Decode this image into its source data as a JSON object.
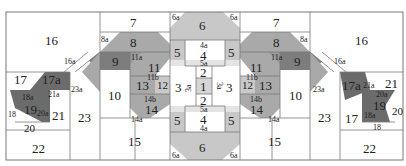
{
  "colors": {
    "background": "#ffffff",
    "light_gray": "#c8c8c8",
    "mid_gray": "#a9a9a9",
    "dark_gray": "#7d7d7d",
    "darkest_gray": "#6b6b6b",
    "seam": "#7a7a7a"
  },
  "pieces": {
    "left": {
      "p16": "16",
      "p16a": "16a",
      "p17": "17",
      "p17a": "17a",
      "p18": "18",
      "p18a": "18a",
      "p19": "19",
      "p20": "20",
      "p20a": "20a",
      "p21": "21",
      "p21a": "21a",
      "p22": "22",
      "p23": "23",
      "p23a": "23a",
      "p7": "7",
      "p8": "8",
      "p8a": "8a",
      "p9": "9",
      "p10": "10",
      "p11": "11",
      "p11a": "11a",
      "p11b": "11b",
      "p12": "12",
      "p13": "13",
      "p14": "14",
      "p14a": "14a",
      "p14b": "14b",
      "p15": "15"
    },
    "center": {
      "p1": "1",
      "p2": "2",
      "p3": "3",
      "p3a": "3a",
      "p4": "4",
      "p4a": "4a",
      "p5": "5",
      "p5a": "5a",
      "p6": "6",
      "p6a": "6a"
    },
    "right": {
      "p16": "16",
      "p16a": "16a",
      "p17": "17",
      "p17a": "17a",
      "p18": "18",
      "p18a": "18a",
      "p19": "19",
      "p20": "20",
      "p20a": "20a",
      "p21": "21",
      "p21a": "21a",
      "p22": "22",
      "p23": "23",
      "p23a": "23a",
      "p7": "7",
      "p8": "8",
      "p8a": "8a",
      "p9": "9",
      "p10": "10",
      "p11": "11",
      "p11a": "11a",
      "p11b": "11b",
      "p12": "12",
      "p13": "13",
      "p14": "14",
      "p14a": "14a",
      "p14b": "14b",
      "p15": "15"
    }
  }
}
